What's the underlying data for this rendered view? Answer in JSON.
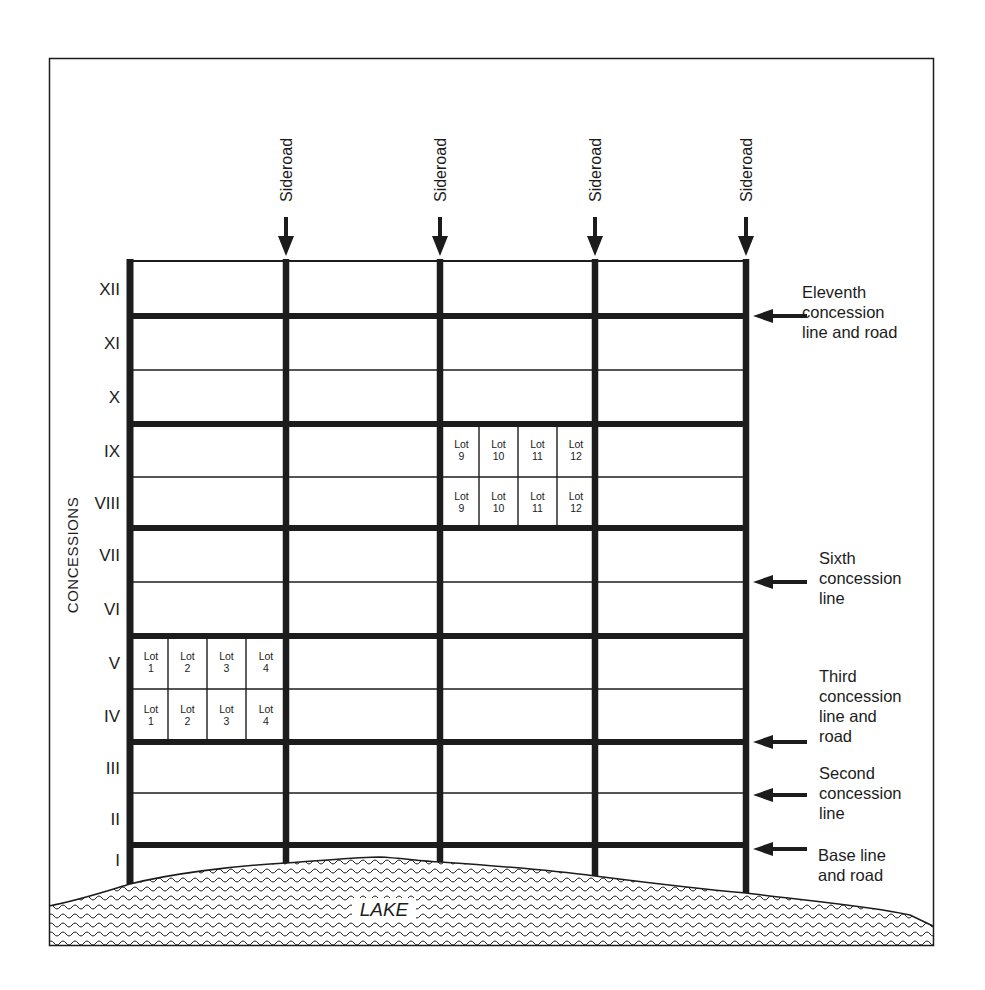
{
  "diagram": {
    "vertical_axis_label": "CONCESSIONS",
    "concessions": [
      "XII",
      "XI",
      "X",
      "IX",
      "VIII",
      "VII",
      "VI",
      "V",
      "IV",
      "III",
      "II",
      "I"
    ],
    "sideroads": [
      {
        "label": "Sideroad"
      },
      {
        "label": "Sideroad"
      },
      {
        "label": "Sideroad"
      },
      {
        "label": "Sideroad"
      }
    ],
    "annotations": [
      {
        "lines": [
          "Eleventh",
          "concession",
          "line and road"
        ]
      },
      {
        "lines": [
          "Sixth",
          "concession",
          "line"
        ]
      },
      {
        "lines": [
          "Third",
          "concession",
          "line and",
          "road"
        ]
      },
      {
        "lines": [
          "Second",
          "concession",
          "line"
        ]
      },
      {
        "lines": [
          "Base line",
          "and road"
        ]
      }
    ],
    "lot_groups": [
      {
        "concession": "IX",
        "lots": [
          {
            "word": "Lot",
            "num": "9"
          },
          {
            "word": "Lot",
            "num": "10"
          },
          {
            "word": "Lot",
            "num": "11"
          },
          {
            "word": "Lot",
            "num": "12"
          }
        ]
      },
      {
        "concession": "VIII",
        "lots": [
          {
            "word": "Lot",
            "num": "9"
          },
          {
            "word": "Lot",
            "num": "10"
          },
          {
            "word": "Lot",
            "num": "11"
          },
          {
            "word": "Lot",
            "num": "12"
          }
        ]
      },
      {
        "concession": "V",
        "lots": [
          {
            "word": "Lot",
            "num": "1"
          },
          {
            "word": "Lot",
            "num": "2"
          },
          {
            "word": "Lot",
            "num": "3"
          },
          {
            "word": "Lot",
            "num": "4"
          }
        ]
      },
      {
        "concession": "IV",
        "lots": [
          {
            "word": "Lot",
            "num": "1"
          },
          {
            "word": "Lot",
            "num": "2"
          },
          {
            "word": "Lot",
            "num": "3"
          },
          {
            "word": "Lot",
            "num": "4"
          }
        ]
      }
    ],
    "lake_label": "LAKE",
    "colors": {
      "ink": "#1c1c1c",
      "paper": "#ffffff"
    }
  }
}
